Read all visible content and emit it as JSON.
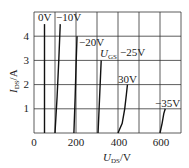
{
  "chart_data": {
    "type": "line",
    "title": "",
    "xlabel": "U_DS/V",
    "ylabel": "I_DS/A",
    "xlim": [
      0,
      700
    ],
    "ylim": [
      0,
      5
    ],
    "xticks": [
      0,
      200,
      400,
      600
    ],
    "yticks": [
      1,
      2,
      3,
      4
    ],
    "grid": true,
    "legend": "inline labels",
    "param_label": "U_GS",
    "series": [
      {
        "name": "0V",
        "points": [
          [
            50,
            0
          ],
          [
            50,
            4.5
          ]
        ]
      },
      {
        "name": "-10V",
        "points": [
          [
            100,
            0
          ],
          [
            110,
            1.5
          ],
          [
            118,
            3
          ],
          [
            125,
            4.5
          ]
        ]
      },
      {
        "name": "-20V",
        "points": [
          [
            190,
            0
          ],
          [
            196,
            1.5
          ],
          [
            201,
            3
          ],
          [
            205,
            4.0
          ]
        ]
      },
      {
        "name": "-25V",
        "points": [
          [
            305,
            0
          ],
          [
            310,
            1
          ],
          [
            315,
            2
          ],
          [
            320,
            3.0
          ]
        ]
      },
      {
        "name": "30V",
        "points": [
          [
            400,
            0
          ],
          [
            420,
            0.4
          ],
          [
            432,
            1.0
          ],
          [
            440,
            1.6
          ],
          [
            445,
            2.0
          ]
        ]
      },
      {
        "name": "-35V",
        "points": [
          [
            600,
            0
          ],
          [
            610,
            0.4
          ],
          [
            618,
            0.8
          ],
          [
            625,
            1.0
          ]
        ]
      }
    ]
  },
  "labels": {
    "s0": "0V",
    "s1": "−10V",
    "s2": "−20V",
    "ugs_main": "U",
    "ugs_sub": "GS",
    "s3": "−25V",
    "s4": "30V",
    "s5": "−35V",
    "x_main": "U",
    "x_sub": "DS",
    "x_unit": "/V",
    "y_main": "I",
    "y_sub": "DS",
    "y_unit": "/A",
    "xt0": "0",
    "xt1": "200",
    "xt2": "400",
    "xt3": "600",
    "yt1": "1",
    "yt2": "2",
    "yt3": "3",
    "yt4": "4"
  }
}
